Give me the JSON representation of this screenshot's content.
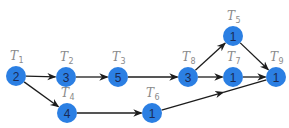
{
  "diagram": {
    "type": "task-precedence-graph",
    "node_color": "#2b7fe3",
    "edge_color": "#1c1c1c",
    "label_color": "#8a8a8a",
    "nodes": [
      {
        "id": "T1",
        "label_main": "T",
        "label_sub": "1",
        "value": "2",
        "x": 16,
        "y": 76,
        "lx": 10,
        "ly": 60
      },
      {
        "id": "T2",
        "label_main": "T",
        "label_sub": "2",
        "value": "3",
        "x": 66,
        "y": 77,
        "lx": 60,
        "ly": 61
      },
      {
        "id": "T3",
        "label_main": "T",
        "label_sub": "3",
        "value": "5",
        "x": 118,
        "y": 77,
        "lx": 112,
        "ly": 61
      },
      {
        "id": "T4",
        "label_main": "T",
        "label_sub": "4",
        "value": "4",
        "x": 67,
        "y": 113,
        "lx": 61,
        "ly": 97
      },
      {
        "id": "T5",
        "label_main": "T",
        "label_sub": "5",
        "value": "1",
        "x": 233,
        "y": 36,
        "lx": 227,
        "ly": 20
      },
      {
        "id": "T6",
        "label_main": "T",
        "label_sub": "6",
        "value": "1",
        "x": 152,
        "y": 113,
        "lx": 146,
        "ly": 97
      },
      {
        "id": "T7",
        "label_main": "T",
        "label_sub": "7",
        "value": "1",
        "x": 233,
        "y": 77,
        "lx": 227,
        "ly": 61
      },
      {
        "id": "T8",
        "label_main": "T",
        "label_sub": "8",
        "value": "3",
        "x": 188,
        "y": 77,
        "lx": 182,
        "ly": 61
      },
      {
        "id": "T9",
        "label_main": "T",
        "label_sub": "9",
        "value": "1",
        "x": 276,
        "y": 77,
        "lx": 270,
        "ly": 61
      }
    ],
    "edges": [
      {
        "from": "T1",
        "to": "T2"
      },
      {
        "from": "T1",
        "to": "T4"
      },
      {
        "from": "T2",
        "to": "T3"
      },
      {
        "from": "T3",
        "to": "T8"
      },
      {
        "from": "T4",
        "to": "T6"
      },
      {
        "from": "T8",
        "to": "T5"
      },
      {
        "from": "T8",
        "to": "T7"
      },
      {
        "from": "T5",
        "to": "T9"
      },
      {
        "from": "T7",
        "to": "T9"
      },
      {
        "from": "T6",
        "to": "T9",
        "mid_arrow": true
      }
    ]
  }
}
